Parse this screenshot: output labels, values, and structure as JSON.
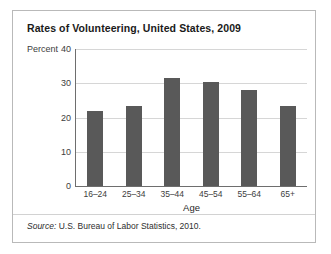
{
  "figure": {
    "title": "Rates of Volunteering, United States, 2009",
    "source_label": "Source:",
    "source_text": "U.S. Bureau of Labor Statistics, 2010.",
    "border_color": "#b9b9b9"
  },
  "chart_data": {
    "type": "bar",
    "title": "Rates of Volunteering, United States, 2009",
    "categories": [
      "16–24",
      "25–34",
      "35–44",
      "45–54",
      "55–64",
      "65+"
    ],
    "values": [
      22.0,
      23.5,
      31.5,
      30.5,
      28.0,
      23.5
    ],
    "xlabel": "Age",
    "ylabel": "Percent",
    "ylim": [
      0,
      40
    ],
    "yticks": [
      0,
      10,
      20,
      30,
      40
    ],
    "ytick_labels": [
      "0",
      "10",
      "20",
      "30",
      "40"
    ],
    "grid": true,
    "legend": false,
    "bar_color": "#595959",
    "gridline_color": "#d6d6d6",
    "axis_color": "#6e6e6e"
  }
}
